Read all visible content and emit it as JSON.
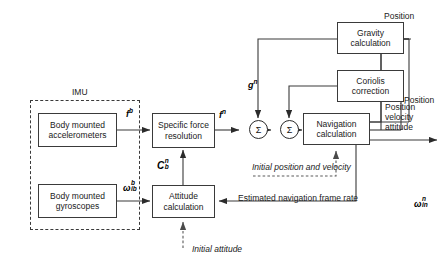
{
  "diagram": {
    "imu_label": "IMU",
    "blocks": {
      "accelerometers": "Body mounted accelerometers",
      "gyroscopes": "Body mounted gyroscopes",
      "specific_force": "Specific force resolution",
      "attitude": "Attitude calculation",
      "navigation": "Navigation calculation",
      "gravity": "Gravity calculation",
      "coriolis": "Coriolis correction"
    },
    "signals": {
      "f_body": "f",
      "f_body_sup": "b",
      "omega_ib_main": "ω",
      "omega_ib_sup": "b",
      "omega_ib_sub": "ib",
      "f_nav": "f",
      "f_nav_sup": "n",
      "g_nav": "g",
      "g_nav_sup": "n",
      "C_main": "C",
      "C_sup": "n",
      "C_sub": "b",
      "omega_in_main": "ω",
      "omega_in_sup": "n",
      "omega_in_sub": "in",
      "sigma": "Σ"
    },
    "annotations": {
      "position": "Position",
      "position_2": "Position",
      "output_line1": "Position",
      "output_line2": "velocity",
      "output_line3": "attitude",
      "initial_position_velocity": "Initial position and velocity",
      "estimated_nav_frame_rate": "Estimated navigation frame rate",
      "initial_attitude": "Initial attitude"
    },
    "colors": {
      "line": "#3a3a3a",
      "text": "#1a1a1a",
      "background": "#ffffff"
    }
  }
}
